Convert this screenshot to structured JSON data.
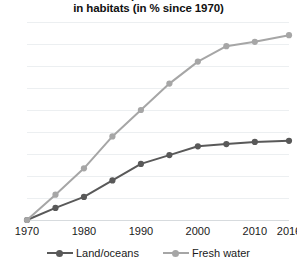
{
  "chart_data": {
    "type": "line",
    "title": "Decline of species abundance\nin habitats (in % since 1970)",
    "title_visible_line": "in habitats (in % since 1970)",
    "xlabel": "",
    "ylabel": "",
    "x": [
      1970,
      1975,
      1980,
      1985,
      1990,
      1995,
      2000,
      2005,
      2010,
      2016
    ],
    "categories": [
      "1970",
      "1975",
      "1980",
      "1985",
      "1990",
      "1995",
      "2000",
      "2005",
      "2010",
      "2016"
    ],
    "xtick_labels": [
      "1970",
      "1980",
      "1990",
      "2000",
      "2010",
      "2016"
    ],
    "xtick_values": [
      1970,
      1980,
      1990,
      2000,
      2010,
      2016
    ],
    "ytick_labels": [
      "0",
      "10",
      "20",
      "30",
      "40",
      "50",
      "60",
      "70",
      "80",
      "90"
    ],
    "ytick_values": [
      0,
      10,
      20,
      30,
      40,
      50,
      60,
      70,
      80,
      90
    ],
    "xlim": [
      1970,
      2016
    ],
    "ylim": [
      0,
      90
    ],
    "grid": true,
    "grid_axis": "y",
    "legend_position": "bottom",
    "series": [
      {
        "name": "Land/oceans",
        "color": "#595959",
        "marker": "circle",
        "values": [
          0,
          5.5,
          10.5,
          18,
          25.5,
          29.5,
          33.5,
          34.5,
          35.5,
          36
        ]
      },
      {
        "name": "Fresh water",
        "color": "#a6a6a6",
        "marker": "circle",
        "values": [
          0,
          11.5,
          23.5,
          38,
          50,
          62,
          72,
          79,
          81,
          84
        ]
      }
    ]
  },
  "colors": {
    "background": "#ffffff",
    "gridline": "#eceff1",
    "baseline": "#d7dbde",
    "text": "#1a1a1a",
    "land_oceans": "#595959",
    "fresh_water": "#a6a6a6"
  }
}
